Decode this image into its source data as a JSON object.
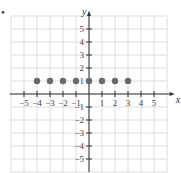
{
  "bullet": "•",
  "chart_data": {
    "type": "scatter",
    "title": "",
    "xlabel": "x",
    "ylabel": "y",
    "xlim": [
      -5.5,
      5.5
    ],
    "ylim": [
      -5.5,
      5.5
    ],
    "grid": true,
    "x_ticks": [
      -5,
      -4,
      -3,
      -2,
      -1,
      1,
      2,
      3,
      4,
      5
    ],
    "y_ticks": [
      -5,
      -4,
      -3,
      -2,
      -1,
      1,
      2,
      3,
      4,
      5
    ],
    "x_tick_labels": [
      "−5",
      "−4",
      "−3",
      "−2",
      "−1",
      "1",
      "2",
      "3",
      "4",
      "5"
    ],
    "y_tick_labels": [
      "−5",
      "−4",
      "−3",
      "−2",
      "−1",
      "1",
      "2",
      "3",
      "4",
      "5"
    ],
    "points": [
      {
        "x": -4,
        "y": 1
      },
      {
        "x": -3,
        "y": 1
      },
      {
        "x": -2,
        "y": 1
      },
      {
        "x": -1,
        "y": 1
      },
      {
        "x": 0,
        "y": 1
      },
      {
        "x": 1,
        "y": 1
      },
      {
        "x": 2,
        "y": 1
      },
      {
        "x": 3,
        "y": 1
      }
    ],
    "point_color": "#6b6b6b"
  }
}
